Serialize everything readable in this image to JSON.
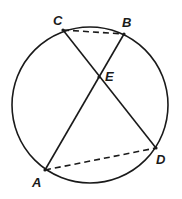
{
  "diagram": {
    "type": "circle-with-intersecting-chords",
    "circle": {
      "cx": 90,
      "cy": 105,
      "r": 78
    },
    "points": {
      "A": {
        "label": "A",
        "x": 45,
        "y": 170
      },
      "B": {
        "label": "B",
        "x": 124,
        "y": 34
      },
      "C": {
        "label": "C",
        "x": 63,
        "y": 30
      },
      "D": {
        "label": "D",
        "x": 156,
        "y": 148
      },
      "E": {
        "label": "E",
        "x": 99,
        "y": 77
      }
    },
    "chords": [
      {
        "from": "A",
        "to": "B",
        "style": "solid"
      },
      {
        "from": "C",
        "to": "D",
        "style": "solid"
      }
    ],
    "dashed_segments": [
      {
        "from": "C",
        "to": "B",
        "style": "dashed"
      },
      {
        "from": "A",
        "to": "D",
        "style": "dashed"
      }
    ],
    "colors": {
      "stroke": "#1a1a1a",
      "background": "#ffffff"
    }
  }
}
